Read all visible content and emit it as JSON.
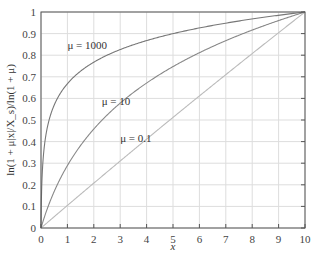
{
  "chart_data": {
    "type": "line",
    "title": "",
    "xlabel": "x",
    "ylabel": "ln(1 + μ|x|/X_s)/ln(1 + μ)",
    "xlim": [
      0,
      10
    ],
    "ylim": [
      0,
      1
    ],
    "xticks": [
      "0",
      "1",
      "2",
      "3",
      "4",
      "5",
      "6",
      "7",
      "8",
      "9",
      "10"
    ],
    "yticks": [
      "0",
      "0.1",
      "0.2",
      "0.3",
      "0.4",
      "0.5",
      "0.6",
      "0.7",
      "0.8",
      "0.9",
      "1"
    ],
    "grid": true,
    "legend": "inline annotations",
    "x": [
      0,
      0.5,
      1,
      2,
      3,
      4,
      5,
      6,
      7,
      8,
      9,
      10
    ],
    "series": [
      {
        "name": "μ = 1000",
        "mu": 1000,
        "values": [
          0,
          0.55,
          0.67,
          0.77,
          0.83,
          0.87,
          0.9,
          0.93,
          0.95,
          0.97,
          0.98,
          1.0
        ]
      },
      {
        "name": "μ = 10",
        "mu": 10,
        "values": [
          0,
          0.16,
          0.29,
          0.46,
          0.57,
          0.66,
          0.75,
          0.81,
          0.87,
          0.91,
          0.96,
          1.0
        ]
      },
      {
        "name": "μ = 0.1",
        "mu": 0.1,
        "values": [
          0,
          0.05,
          0.1,
          0.2,
          0.3,
          0.4,
          0.5,
          0.6,
          0.7,
          0.8,
          0.9,
          1.0
        ]
      }
    ],
    "annotations": [
      {
        "text": "μ = 1000",
        "x": 1.0,
        "y": 0.83
      },
      {
        "text": "μ = 10",
        "x": 2.3,
        "y": 0.57
      },
      {
        "text": "μ = 0.1",
        "x": 3.0,
        "y": 0.4
      }
    ],
    "colors": {
      "mu1000": "#777777",
      "mu10": "#888888",
      "mu01": "#bbbbbb",
      "grid": "#dddddd",
      "axis": "#555555"
    }
  }
}
